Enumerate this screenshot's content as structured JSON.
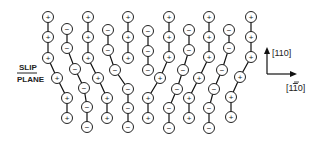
{
  "diagram": {
    "slip_plane_label_top": "SLIP",
    "slip_plane_label_bottom": "PLANE",
    "axis_vertical_label": "[110]",
    "axis_horizontal_label": "[1̅0]",
    "axis_horizontal_parts": [
      "[1",
      "1",
      "0]"
    ],
    "atom_radius": 5.5,
    "chains": [
      {
        "sign": "+",
        "points": [
          [
            48,
            17
          ],
          [
            48,
            37
          ],
          [
            48,
            58
          ],
          [
            57,
            78
          ],
          [
            67,
            98
          ],
          [
            67,
            118
          ]
        ]
      },
      {
        "sign": "-",
        "points": [
          [
            67,
            29
          ],
          [
            67,
            48
          ],
          [
            75,
            69
          ],
          [
            84,
            88
          ],
          [
            87,
            107
          ],
          [
            87,
            127
          ]
        ]
      },
      {
        "sign": "+",
        "points": [
          [
            88,
            17
          ],
          [
            88,
            37
          ],
          [
            88,
            58
          ],
          [
            98,
            78
          ],
          [
            107,
            98
          ],
          [
            107,
            118
          ]
        ]
      },
      {
        "sign": "-",
        "points": [
          [
            108,
            30
          ],
          [
            108,
            50
          ],
          [
            115,
            70
          ],
          [
            128,
            89
          ],
          [
            128,
            108
          ],
          [
            128,
            127
          ]
        ]
      },
      {
        "sign": "+",
        "points": [
          [
            128,
            17
          ],
          [
            128,
            37
          ],
          [
            128,
            58
          ]
        ]
      },
      {
        "sign": "-",
        "points": [
          [
            148,
            31
          ],
          [
            148,
            51
          ],
          [
            148,
            70
          ]
        ]
      },
      {
        "sign": "+",
        "points": [
          [
            169,
            17
          ],
          [
            169,
            37
          ],
          [
            169,
            57
          ],
          [
            160,
            78
          ],
          [
            148,
            98
          ],
          [
            148,
            118
          ]
        ]
      },
      {
        "sign": "-",
        "points": [
          [
            189,
            30
          ],
          [
            189,
            50
          ],
          [
            183,
            70
          ],
          [
            177,
            89
          ],
          [
            169,
            108
          ],
          [
            169,
            128
          ]
        ]
      },
      {
        "sign": "+",
        "points": [
          [
            209,
            17
          ],
          [
            209,
            37
          ],
          [
            209,
            57
          ],
          [
            199,
            78
          ],
          [
            189,
            98
          ],
          [
            189,
            118
          ]
        ]
      },
      {
        "sign": "-",
        "points": [
          [
            229,
            30
          ],
          [
            229,
            48
          ],
          [
            222,
            70
          ],
          [
            214,
            89
          ],
          [
            209,
            108
          ],
          [
            209,
            128
          ]
        ]
      },
      {
        "sign": "+",
        "points": [
          [
            251,
            17
          ],
          [
            251,
            37
          ],
          [
            251,
            57
          ],
          [
            240,
            77
          ],
          [
            231,
            97
          ],
          [
            231,
            117
          ]
        ]
      }
    ]
  }
}
